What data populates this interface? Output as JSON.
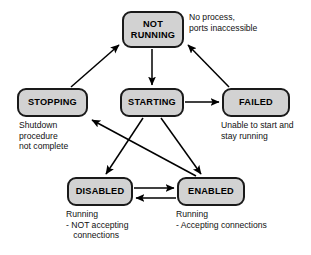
{
  "diagram": {
    "colors": {
      "node_fill": "#d2d2d2",
      "node_border": "#1a1a1a",
      "edge": "#000000",
      "text": "#000000",
      "background": "#ffffff"
    },
    "nodes": [
      {
        "id": "not_running",
        "label": "NOT\nRUNNING",
        "line1": "NOT",
        "line2": "RUNNING"
      },
      {
        "id": "stopping",
        "label": "STOPPING"
      },
      {
        "id": "starting",
        "label": "STARTING"
      },
      {
        "id": "failed",
        "label": "FAILED"
      },
      {
        "id": "disabled",
        "label": "DISABLED"
      },
      {
        "id": "enabled",
        "label": "ENABLED"
      }
    ],
    "captions": [
      {
        "id": "cap_not_running",
        "for": "not_running",
        "text": "No process,\nports inaccessible"
      },
      {
        "id": "cap_stopping",
        "for": "stopping",
        "text": "Shutdown\nprocedure\nnot complete"
      },
      {
        "id": "cap_failed",
        "for": "failed",
        "text": "Unable to start and\nstay running"
      },
      {
        "id": "cap_disabled",
        "for": "disabled",
        "text": "Running\n- NOT accepting\n   connections"
      },
      {
        "id": "cap_enabled",
        "for": "enabled",
        "text": "Running\n- Accepting connections"
      }
    ],
    "edges": [
      {
        "id": "e_stopping_notrunning",
        "from": "stopping",
        "to": "not_running",
        "label": ""
      },
      {
        "id": "e_failed_notrunning",
        "from": "failed",
        "to": "not_running",
        "label": ""
      },
      {
        "id": "e_notrunning_starting",
        "from": "not_running",
        "to": "starting",
        "label": ""
      },
      {
        "id": "e_starting_failed",
        "from": "starting",
        "to": "failed",
        "label": ""
      },
      {
        "id": "e_starting_disabled",
        "from": "starting",
        "to": "disabled",
        "label": ""
      },
      {
        "id": "e_starting_enabled",
        "from": "starting",
        "to": "enabled",
        "label": ""
      },
      {
        "id": "e_enabled_stopping",
        "from": "enabled",
        "to": "stopping",
        "label": ""
      },
      {
        "id": "e_disabled_enabled",
        "from": "disabled",
        "to": "enabled",
        "label": ""
      },
      {
        "id": "e_enabled_disabled",
        "from": "enabled",
        "to": "disabled",
        "label": ""
      }
    ]
  }
}
